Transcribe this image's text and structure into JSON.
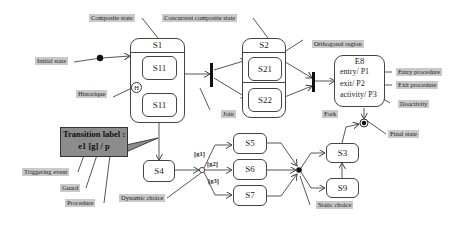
{
  "diagram": {
    "type": "UML state machine",
    "states": {
      "s1": {
        "label": "S1"
      },
      "s11_top": {
        "label": "S11"
      },
      "s11_bottom": {
        "label": "S11"
      },
      "s2": {
        "label": "S2"
      },
      "s21": {
        "label": "S21"
      },
      "s22": {
        "label": "S22"
      },
      "e8": {
        "label": "E8",
        "entry": "entry/ P1",
        "exit": "exit/ P2",
        "activity": "activity/ P3"
      },
      "s3": {
        "label": "S3"
      },
      "s4": {
        "label": "S4"
      },
      "s5": {
        "label": "S5"
      },
      "s6": {
        "label": "S6"
      },
      "s7": {
        "label": "S7"
      },
      "s9": {
        "label": "S9"
      },
      "history": {
        "label": "H"
      }
    },
    "guards": {
      "g1": "[g1]",
      "g2": "[g2]",
      "g3": "[g3]"
    },
    "transition_box": {
      "title": "Transition label :",
      "syntax": "e1 [g] / p"
    },
    "annotations": {
      "composite_state": "Composite state",
      "concurrent_composite_state": "Concurrent composite state",
      "orthogonal_region": "Orthogonal region",
      "initial_state": "Initial state",
      "historique": "Historique",
      "join": "Join",
      "fork": "Fork",
      "entry_procedure": "Entry procedure",
      "exit_procedure": "Exit procedure",
      "do_activity": "Doactivity",
      "final_state": "Final state",
      "triggering_event": "Triggering event",
      "guard": "Guard",
      "procedure": "Procedure",
      "dynamic_choice": "Dynamic choice",
      "static_choice": "Static choice"
    },
    "colors": {
      "label_bg": "#c9c9c9",
      "transition_box_bg": "#8c8c8c",
      "line": "#444444"
    }
  }
}
